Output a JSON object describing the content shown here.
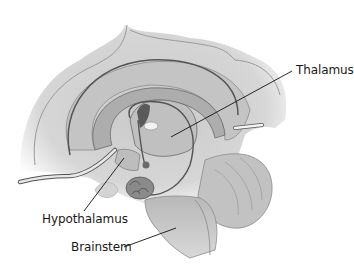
{
  "diagram": {
    "labels": {
      "thalamus": "Thalamus",
      "hypothalamus": "Hypothalamus",
      "brainstem": "Brainstem"
    },
    "colors": {
      "cortex_light": "#d9d9d9",
      "cortex_mid": "#b5b5b5",
      "outline": "#4a4a4a",
      "dark_structure": "#5a5a5a",
      "leader_line": "#111111",
      "label_text": "#1a1a1a"
    }
  }
}
